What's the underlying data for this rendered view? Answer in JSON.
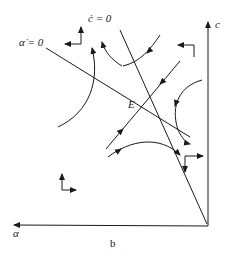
{
  "diagram": {
    "caption": "b",
    "axes": {
      "vertical": "c",
      "horizontal": "α"
    },
    "isoclines": {
      "alpha_dot": "α̇ = 0",
      "c_dot": "ċ = 0"
    },
    "equilibrium": "E",
    "colors": {
      "ink": "#1a1a1a",
      "background": "#ffffff"
    }
  }
}
